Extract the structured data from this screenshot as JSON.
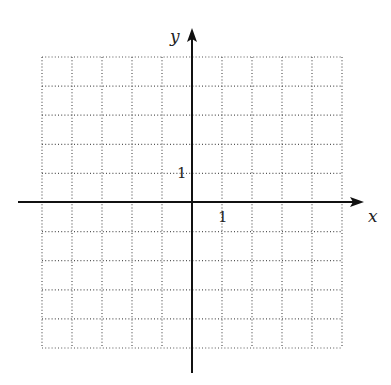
{
  "diagram": {
    "type": "coordinate-grid",
    "axes": {
      "x_label": "x",
      "y_label": "y",
      "x_tick_label": "1",
      "y_tick_label": "1"
    },
    "grid": {
      "columns": 10,
      "rows": 10,
      "x_range": [
        -5,
        5
      ],
      "y_range": [
        -5,
        5
      ],
      "line_style": "dotted"
    },
    "colors": {
      "axis": "#111111",
      "grid": "#555555",
      "background": "#ffffff"
    }
  }
}
